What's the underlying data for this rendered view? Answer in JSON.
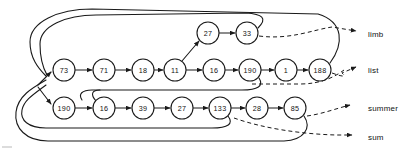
{
  "diagram": {
    "type": "linked-list-hash-chain",
    "background_color": "#ffffff",
    "ink_color": "#1a1a1a",
    "nodes": {
      "top_branch": [
        {
          "id": "t1",
          "value": "27",
          "cx": 208,
          "cy": 33,
          "r": 11
        },
        {
          "id": "t2",
          "value": "33",
          "cx": 247,
          "cy": 33,
          "r": 11
        }
      ],
      "middle_row": [
        {
          "id": "m1",
          "value": "73",
          "cx": 64,
          "cy": 70,
          "r": 11
        },
        {
          "id": "m2",
          "value": "71",
          "cx": 104,
          "cy": 70,
          "r": 11
        },
        {
          "id": "m3",
          "value": "18",
          "cx": 143,
          "cy": 70,
          "r": 11
        },
        {
          "id": "m4",
          "value": "11",
          "cx": 175,
          "cy": 70,
          "r": 11
        },
        {
          "id": "m5",
          "value": "16",
          "cx": 214,
          "cy": 70,
          "r": 11
        },
        {
          "id": "m6",
          "value": "190",
          "cx": 250,
          "cy": 70,
          "r": 11
        },
        {
          "id": "m7",
          "value": "1",
          "cx": 286,
          "cy": 70,
          "r": 11
        },
        {
          "id": "m8",
          "value": "188",
          "cx": 320,
          "cy": 70,
          "r": 11
        }
      ],
      "bottom_row": [
        {
          "id": "b1",
          "value": "190",
          "cx": 64,
          "cy": 108,
          "r": 11
        },
        {
          "id": "b2",
          "value": "16",
          "cx": 104,
          "cy": 108,
          "r": 11
        },
        {
          "id": "b3",
          "value": "39",
          "cx": 143,
          "cy": 108,
          "r": 11
        },
        {
          "id": "b4",
          "value": "27",
          "cx": 182,
          "cy": 108,
          "r": 11
        },
        {
          "id": "b5",
          "value": "133",
          "cx": 220,
          "cy": 108,
          "r": 11
        },
        {
          "id": "b6",
          "value": "28",
          "cx": 257,
          "cy": 108,
          "r": 11
        },
        {
          "id": "b7",
          "value": "85",
          "cx": 295,
          "cy": 108,
          "r": 11
        }
      ]
    },
    "pointer_labels": [
      {
        "id": "p-limb",
        "text": "limb",
        "x": 368,
        "y": 34
      },
      {
        "id": "p-list",
        "text": "list",
        "x": 368,
        "y": 70
      },
      {
        "id": "p-summer",
        "text": "summer",
        "x": 368,
        "y": 108
      },
      {
        "id": "p-sum",
        "text": "sum",
        "x": 368,
        "y": 137
      }
    ]
  }
}
